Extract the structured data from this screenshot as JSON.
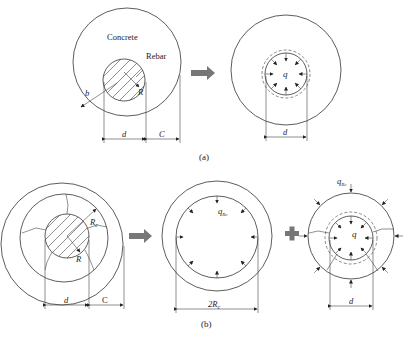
{
  "figure": {
    "panel_a": {
      "caption": "(a)",
      "left": {
        "concrete_label": "Concrete",
        "rebar_label": "Rebar",
        "radius_label": "R",
        "cover_radius_label": "b",
        "diameter_label": "d",
        "cover_label": "C"
      },
      "right": {
        "pressure_label": "q",
        "diameter_label": "d"
      },
      "transition_icon": "right-arrow-icon"
    },
    "panel_b": {
      "caption": "(b)",
      "left": {
        "crack_radius_label": "R",
        "crack_radius_sub": "c",
        "radius_label": "R",
        "diameter_label": "d",
        "cover_label": "C"
      },
      "middle": {
        "pressure_label": "q",
        "pressure_sub": "Rc",
        "diameter_label": "2R",
        "diameter_sub": "c"
      },
      "right": {
        "outer_pressure_label": "q",
        "outer_pressure_sub": "Rc",
        "inner_pressure_label": "q",
        "diameter_label": "d"
      },
      "transition_icon": "right-arrow-icon",
      "combine_icon": "plus-icon"
    },
    "colors": {
      "line": "#333333",
      "arrow_fill": "#777777",
      "background": "#ffffff"
    }
  }
}
